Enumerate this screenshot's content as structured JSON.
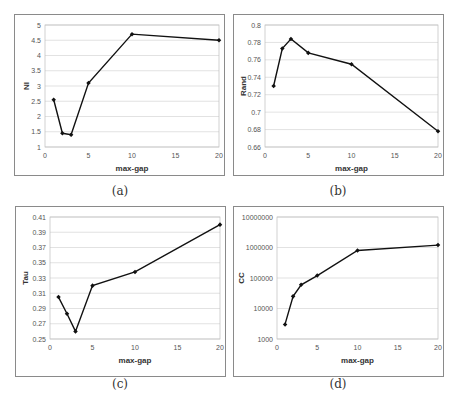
{
  "chart_data": [
    {
      "id": "a",
      "type": "line",
      "caption": "(a)",
      "title": "",
      "xlabel": "max-gap",
      "ylabel": "NI",
      "x": [
        1,
        2,
        3,
        5,
        10,
        20
      ],
      "series": [
        {
          "name": "NI",
          "values": [
            2.55,
            1.45,
            1.4,
            3.1,
            4.7,
            4.5
          ]
        }
      ],
      "xlim": [
        0,
        20
      ],
      "xticks": [
        0,
        5,
        10,
        15,
        20
      ],
      "ylim": [
        1,
        5
      ],
      "yticks": [
        1,
        1.5,
        2,
        2.5,
        3,
        3.5,
        4,
        4.5,
        5
      ],
      "yscale": "linear",
      "grid": "horizontal",
      "legend": "none"
    },
    {
      "id": "b",
      "type": "line",
      "caption": "(b)",
      "title": "",
      "xlabel": "max-gap",
      "ylabel": "Rand",
      "x": [
        1,
        2,
        3,
        5,
        10,
        20
      ],
      "series": [
        {
          "name": "Rand",
          "values": [
            0.73,
            0.773,
            0.784,
            0.768,
            0.755,
            0.678
          ]
        }
      ],
      "xlim": [
        0,
        20
      ],
      "xticks": [
        0,
        5,
        10,
        15,
        20
      ],
      "ylim": [
        0.66,
        0.8
      ],
      "yticks": [
        0.66,
        0.68,
        0.7,
        0.72,
        0.74,
        0.76,
        0.78,
        0.8
      ],
      "yscale": "linear",
      "grid": "horizontal",
      "legend": "none"
    },
    {
      "id": "c",
      "type": "line",
      "caption": "(c)",
      "title": "",
      "xlabel": "max-gap",
      "ylabel": "Tau",
      "x": [
        1,
        2,
        3,
        5,
        10,
        20
      ],
      "series": [
        {
          "name": "Tau",
          "values": [
            0.305,
            0.283,
            0.26,
            0.32,
            0.338,
            0.4
          ]
        }
      ],
      "xlim": [
        0,
        20
      ],
      "xticks": [
        0,
        5,
        10,
        15,
        20
      ],
      "ylim": [
        0.25,
        0.41
      ],
      "yticks": [
        0.25,
        0.27,
        0.29,
        0.31,
        0.33,
        0.35,
        0.37,
        0.39,
        0.41
      ],
      "yscale": "linear",
      "grid": "horizontal",
      "legend": "none"
    },
    {
      "id": "d",
      "type": "line",
      "caption": "(d)",
      "title": "",
      "xlabel": "max-gap",
      "ylabel": "CC",
      "x": [
        1,
        2,
        3,
        5,
        10,
        20
      ],
      "series": [
        {
          "name": "CC",
          "values": [
            3000,
            25000,
            60000,
            120000,
            800000,
            1200000
          ]
        }
      ],
      "xlim": [
        0,
        20
      ],
      "xticks": [
        0,
        5,
        10,
        15,
        20
      ],
      "ylim": [
        1000,
        10000000
      ],
      "yticks": [
        1000,
        10000,
        100000,
        1000000,
        10000000
      ],
      "yscale": "log",
      "grid": "horizontal",
      "legend": "none"
    }
  ],
  "colors": {
    "line": "#111111",
    "grid": "#cfcfcf",
    "frame": "#8a8a8a",
    "plot_border": "#bdbdbd"
  }
}
